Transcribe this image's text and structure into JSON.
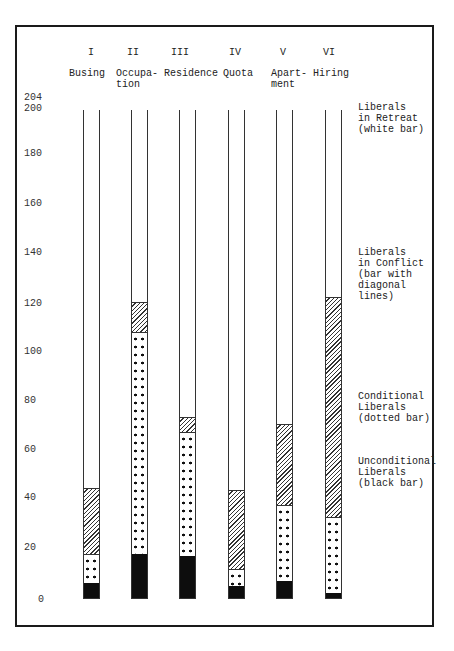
{
  "chart_data": {
    "type": "bar",
    "stacked": true,
    "title": "",
    "xlabel": "",
    "ylabel": "",
    "ylim": [
      0,
      204
    ],
    "yticks": [
      0,
      20,
      40,
      60,
      80,
      100,
      120,
      140,
      160,
      180,
      200,
      204
    ],
    "grid": false,
    "legend_position": "right",
    "roman_numerals": [
      "I",
      "II",
      "III",
      "IV",
      "V",
      "VI"
    ],
    "categories": [
      "Busing",
      "Occupation",
      "Residence",
      "Quota",
      "Apartment",
      "Hiring"
    ],
    "category_display": [
      "Busing",
      "Occupa-\ntion",
      "Residence",
      "Quota",
      "Apart-\nment",
      "Hiring"
    ],
    "series": [
      {
        "name": "Unconditional Liberals",
        "pattern": "black bar",
        "values": [
          6,
          18,
          17,
          5,
          7,
          2
        ]
      },
      {
        "name": "Conditional Liberals",
        "pattern": "dotted bar",
        "values": [
          12,
          91,
          51,
          7,
          31,
          31
        ]
      },
      {
        "name": "Liberals in Conflict",
        "pattern": "bar with diagonal lines",
        "values": [
          27,
          12,
          6,
          32,
          33,
          90
        ]
      },
      {
        "name": "Liberals in Retreat",
        "pattern": "white bar",
        "values": [
          155,
          79,
          126,
          156,
          129,
          77
        ]
      }
    ],
    "cumulative_boundaries": {
      "Busing": [
        6,
        18,
        45,
        200
      ],
      "Occupation": [
        18,
        109,
        121,
        200
      ],
      "Residence": [
        17,
        68,
        74,
        200
      ],
      "Quota": [
        5,
        12,
        44,
        200
      ],
      "Apartment": [
        7,
        38,
        71,
        200
      ],
      "Hiring": [
        2,
        33,
        123,
        200
      ]
    },
    "total": 200
  },
  "axis": {
    "ticks": [
      "204",
      "200",
      "180",
      "160",
      "140",
      "120",
      "100",
      "80",
      "60",
      "40",
      "20",
      "0"
    ]
  },
  "legend": {
    "retreat": "Liberals\nin Retreat\n(white bar)",
    "conflict": "Liberals\nin Conflict\n(bar with\ndiagonal\nlines)",
    "conditional": "Conditional\nLiberals\n(dotted bar)",
    "unconditional": "Unconditional\nLiberals\n(black bar)"
  }
}
